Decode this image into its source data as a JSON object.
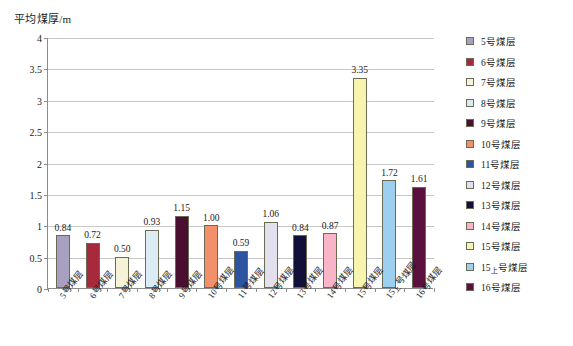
{
  "chart_data": {
    "type": "bar",
    "title": "平均煤厚/m",
    "xlabel": "",
    "ylabel": "平均煤厚/m",
    "ylim": [
      0,
      4
    ],
    "ytick_step": 0.5,
    "yticks": [
      "4",
      "3.5",
      "3",
      "2.5",
      "2",
      "1.5",
      "1",
      "0.5",
      "0"
    ],
    "grid": true,
    "legend_position": "right",
    "categories": [
      "5号煤层",
      "6号煤层",
      "7号煤层",
      "8号煤层",
      "9号煤层",
      "10号煤层",
      "11号煤层",
      "12号煤层",
      "13号煤层",
      "14号煤层",
      "15号煤层",
      "15上号煤层",
      "16号煤层"
    ],
    "values": [
      0.84,
      0.72,
      0.5,
      0.93,
      1.15,
      1.0,
      0.59,
      1.06,
      0.84,
      0.87,
      3.35,
      1.72,
      1.61
    ],
    "value_labels": [
      "0.84",
      "0.72",
      "0.50",
      "0.93",
      "1.15",
      "1.00",
      "0.59",
      "1.06",
      "0.84",
      "0.87",
      "3.35",
      "1.72",
      "1.61"
    ],
    "colors": [
      "#a8a0c0",
      "#a62a3c",
      "#f5f2d8",
      "#dcecf4",
      "#4a0f30",
      "#f2906c",
      "#2c54a0",
      "#e2e0ec",
      "#120f38",
      "#f9b4c8",
      "#f7f4b0",
      "#9cd0ee",
      "#5c1040"
    ],
    "bar_border_color": "#6b6b55",
    "axis_color": "#8c8c8c",
    "gridline_color": "#c8c8c8",
    "legend": [
      {
        "label": "5号煤层",
        "base": "5",
        "sub": "",
        "suffix": "号煤层",
        "color": "#a8a0c0"
      },
      {
        "label": "6号煤层",
        "base": "6",
        "sub": "",
        "suffix": "号煤层",
        "color": "#a62a3c"
      },
      {
        "label": "7号煤层",
        "base": "7",
        "sub": "",
        "suffix": "号煤层",
        "color": "#f5f2d8"
      },
      {
        "label": "8号煤层",
        "base": "8",
        "sub": "",
        "suffix": "号煤层",
        "color": "#dcecf4"
      },
      {
        "label": "9号煤层",
        "base": "9",
        "sub": "",
        "suffix": "号煤层",
        "color": "#4a0f30"
      },
      {
        "label": "10号煤层",
        "base": "10",
        "sub": "",
        "suffix": "号煤层",
        "color": "#f2906c"
      },
      {
        "label": "11号煤层",
        "base": "11",
        "sub": "",
        "suffix": "号煤层",
        "color": "#2c54a0"
      },
      {
        "label": "12号煤层",
        "base": "12",
        "sub": "",
        "suffix": "号煤层",
        "color": "#e2e0ec"
      },
      {
        "label": "13号煤层",
        "base": "13",
        "sub": "",
        "suffix": "号煤层",
        "color": "#120f38"
      },
      {
        "label": "14号煤层",
        "base": "14",
        "sub": "",
        "suffix": "号煤层",
        "color": "#f9b4c8"
      },
      {
        "label": "15号煤层",
        "base": "15",
        "sub": "",
        "suffix": "号煤层",
        "color": "#f7f4b0"
      },
      {
        "label": "15上号煤层",
        "base": "15",
        "sub": "上",
        "suffix": "号煤层",
        "color": "#9cd0ee"
      },
      {
        "label": "16号煤层",
        "base": "16",
        "sub": "",
        "suffix": "号煤层",
        "color": "#5c1040"
      }
    ]
  }
}
